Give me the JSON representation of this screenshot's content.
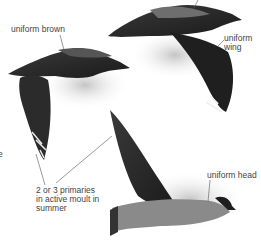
{
  "illustration": {
    "subject": "skua in flight, three views",
    "labels": {
      "uniform_brown": "uniform brown",
      "uniform_wing": "uniform\nwing",
      "primaries": "2 or 3 primaries\nin active moult in\nsummer",
      "uniform_head": "uniform head",
      "edge_fragment": "e"
    }
  }
}
